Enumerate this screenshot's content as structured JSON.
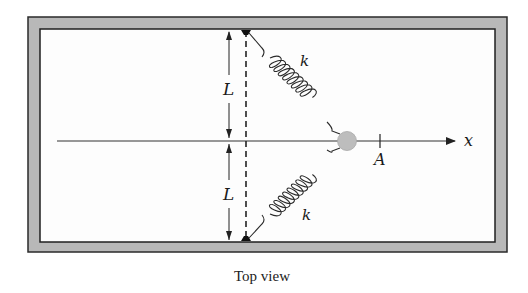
{
  "diagram": {
    "caption": "Top view",
    "labels": {
      "length_upper": "L",
      "length_lower": "L",
      "spring_upper": "k",
      "spring_lower": "k",
      "amplitude": "A",
      "axis": "x"
    },
    "colors": {
      "frame": "#b8b8b8",
      "frame_edge": "#2a2a2a",
      "interior": "#fdfdfd",
      "mass": "#bdbdbd",
      "line": "#333333"
    },
    "elements": {
      "frame": "rectangular enclosure (table top)",
      "mass": "gray circular mass at origin",
      "springs": "two springs from wall anchor points to mass",
      "dashed_line": "vertical dashed line through anchor points",
      "x_axis": "horizontal axis with arrow pointing right",
      "tick": "tick mark at position A"
    }
  }
}
